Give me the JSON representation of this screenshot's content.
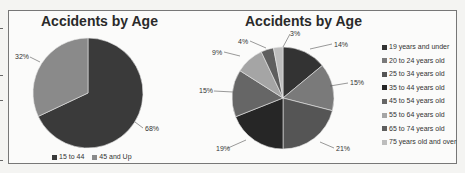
{
  "chart_data": [
    {
      "type": "pie",
      "title": "Accidents by Age",
      "categories": [
        "15 to 44",
        "45 and Up"
      ],
      "values": [
        68,
        32
      ],
      "labels": [
        "68%",
        "32%"
      ],
      "colors": [
        "#3a3a3a",
        "#8a8a8a"
      ],
      "legend_position": "bottom"
    },
    {
      "type": "pie",
      "title": "Accidents by Age",
      "categories": [
        "19 years and under",
        "20 to 24 years old",
        "25 to 34 years old",
        "35 to 44 years old",
        "45 to 54 years old",
        "55 to 64 years old",
        "65 to 74 years old",
        "75 years old and over"
      ],
      "values": [
        14,
        15,
        21,
        19,
        15,
        9,
        4,
        3
      ],
      "labels": [
        "14%",
        "15%",
        "21%",
        "19%",
        "15%",
        "9%",
        "4%",
        "3%"
      ],
      "colors": [
        "#333333",
        "#7a7a7a",
        "#555555",
        "#262626",
        "#666666",
        "#a5a5a5",
        "#5e5e5e",
        "#bdbdbd"
      ],
      "legend_position": "right"
    }
  ],
  "chart1": {
    "title": "Accidents by Age",
    "legend": [
      {
        "label": "15 to 44",
        "color": "#3a3a3a"
      },
      {
        "label": "45 and Up",
        "color": "#8a8a8a"
      }
    ],
    "pct": {
      "a": "68%",
      "b": "32%"
    }
  },
  "chart2": {
    "title": "Accidents by Age",
    "legend": [
      {
        "label": "19 years and under",
        "color": "#333333"
      },
      {
        "label": "20 to 24 years old",
        "color": "#7a7a7a"
      },
      {
        "label": "25 to 34 years old",
        "color": "#555555"
      },
      {
        "label": "35 to 44 years old",
        "color": "#262626"
      },
      {
        "label": "45 to 54 years old",
        "color": "#666666"
      },
      {
        "label": "55 to 64 years old",
        "color": "#a5a5a5"
      },
      {
        "label": "65 to 74 years old",
        "color": "#5e5e5e"
      },
      {
        "label": "75 years old and over",
        "color": "#bdbdbd"
      }
    ],
    "pct": [
      "14%",
      "15%",
      "21%",
      "19%",
      "15%",
      "9%",
      "4%",
      "3%"
    ]
  }
}
